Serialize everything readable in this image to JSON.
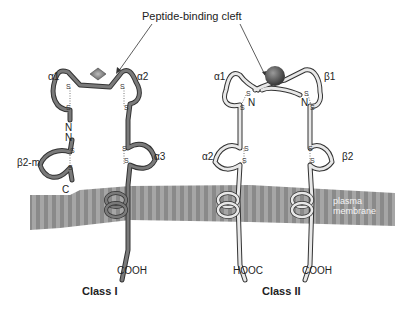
{
  "title": "Peptide-binding cleft",
  "class1": {
    "label": "Class I",
    "domains": {
      "a1": "α1",
      "a2": "α2",
      "a3": "α3",
      "b2m": "β2-m"
    },
    "termini": {
      "n1": "N",
      "n2": "N",
      "c": "C",
      "cooh": "COOH"
    },
    "peptide_shape": "diamond"
  },
  "class2": {
    "label": "Class II",
    "domains": {
      "a1": "α1",
      "b1": "β1",
      "a2": "α2",
      "b2": "β2"
    },
    "termini": {
      "n_left": "N",
      "n_right": "N",
      "hooc": "HOOC",
      "cooh": "COOH"
    },
    "peptide_shape": "sphere"
  },
  "membrane": {
    "line1": "plasma",
    "line2": "membrane"
  },
  "disulfide": "S",
  "colors": {
    "class1_chain": "#7a7a7a",
    "class2_chain": "#e6e6e6",
    "membrane": "#8c8c8c",
    "membrane_stripe": "#a8a8a8"
  }
}
